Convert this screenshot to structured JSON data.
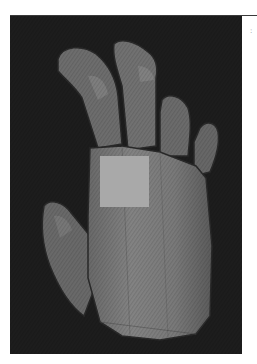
{
  "figure": {
    "background_color": "#1d1d1d",
    "hand_color": "#7a7a7a",
    "patch_color": "#a9a9a9",
    "side_mark": ":"
  }
}
